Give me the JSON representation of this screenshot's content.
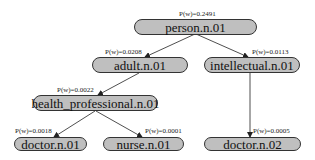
{
  "diagram": {
    "type": "tree",
    "nodes": [
      {
        "id": "person",
        "label": "person.n.01",
        "prob": "P(w)=0.2491"
      },
      {
        "id": "adult",
        "label": "adult.n.01",
        "prob": "P(w)=0.0208"
      },
      {
        "id": "intellectual",
        "label": "intellectual.n.01",
        "prob": "P(w)=0.0113"
      },
      {
        "id": "health_professional",
        "label": "health_professional.n.01",
        "prob": "P(w)=0.0022"
      },
      {
        "id": "doctor1",
        "label": "doctor.n.01",
        "prob": "P(w)=0.0018"
      },
      {
        "id": "nurse",
        "label": "nurse.n.01",
        "prob": "P(w)=0.0001"
      },
      {
        "id": "doctor2",
        "label": "doctor.n.02",
        "prob": "P(w)=0.0005"
      }
    ],
    "edges": [
      {
        "from": "person",
        "to": "adult"
      },
      {
        "from": "person",
        "to": "intellectual"
      },
      {
        "from": "adult",
        "to": "health_professional"
      },
      {
        "from": "intellectual",
        "to": "doctor2"
      },
      {
        "from": "health_professional",
        "to": "doctor1"
      },
      {
        "from": "health_professional",
        "to": "nurse"
      }
    ],
    "colors": {
      "node_fill": "#bfbfbf",
      "node_border": "#333333",
      "edge": "#222222"
    }
  }
}
